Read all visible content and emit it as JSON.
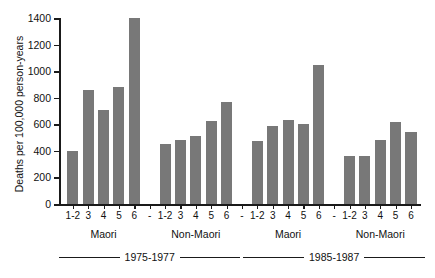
{
  "chart_data": {
    "type": "bar",
    "title": "",
    "xlabel": "",
    "ylabel": "Deaths per 100,000 person-years",
    "ylim": [
      0,
      1400
    ],
    "yticks": [
      0,
      200,
      400,
      600,
      800,
      1000,
      1200,
      1400
    ],
    "grid": false,
    "legend": null,
    "categories": [
      "1-2",
      "3",
      "4",
      "5",
      "6"
    ],
    "group_separator_label": "-",
    "groups": [
      {
        "name": "Maori",
        "period": "1975-1977",
        "categories": [
          "1-2",
          "3",
          "4",
          "5",
          "6"
        ],
        "values": [
          400,
          860,
          710,
          880,
          1400
        ]
      },
      {
        "name": "Non-Maori",
        "period": "1975-1977",
        "categories": [
          "1-2",
          "3",
          "4",
          "5",
          "6"
        ],
        "values": [
          450,
          485,
          515,
          625,
          770
        ]
      },
      {
        "name": "Maori",
        "period": "1985-1987",
        "categories": [
          "1-2",
          "3",
          "4",
          "5",
          "6"
        ],
        "values": [
          475,
          585,
          635,
          600,
          1045
        ]
      },
      {
        "name": "Non-Maori",
        "period": "1985-1987",
        "categories": [
          "1-2",
          "3",
          "4",
          "5",
          "6"
        ],
        "values": [
          360,
          360,
          485,
          615,
          545
        ]
      }
    ],
    "periods": [
      {
        "label": "1975-1977"
      },
      {
        "label": "1985-1987"
      }
    ],
    "colors": {
      "bar": "#787878",
      "axis": "#1a1a1a",
      "background": "#ffffff"
    }
  }
}
